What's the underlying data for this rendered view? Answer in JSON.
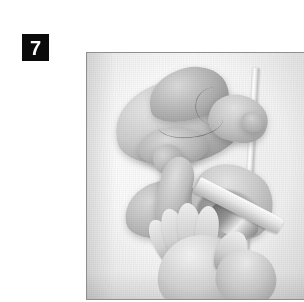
{
  "figure": {
    "step_number": "7",
    "caption": "",
    "alt": "Black and white instructional photograph: a whole raw chicken rests on a cutting board above, while two hands use a knife to cut apart a poultry piece below",
    "subjects": [
      "whole-raw-chicken",
      "cut-poultry-piece",
      "hands",
      "knife",
      "cutting-board"
    ],
    "palette": {
      "page_background": "#ffffff",
      "badge_background": "#0b0b0b",
      "badge_text": "#ffffff",
      "frame_border": "#8d8f91",
      "photo_light": "#f7f7f5",
      "photo_mid": "#c6bfb6",
      "photo_dark": "#3b3b3a"
    },
    "frame": {
      "x": 46,
      "y": 36,
      "width": 236,
      "height": 248
    }
  }
}
